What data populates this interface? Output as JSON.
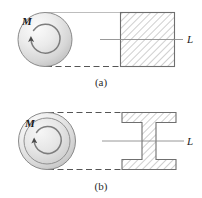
{
  "figure": {
    "kind": "engineering-diagram",
    "background_color": "#ffffff",
    "line_color": "#3a3a3a",
    "hatch_color": "#9a9a9a",
    "disk_fill_light": "#f2f2f2",
    "disk_fill_dark": "#c8c8c8",
    "dash_color": "#5a5a5a"
  },
  "panels": [
    {
      "id": "a",
      "caption": "(a)",
      "torque_label": "M",
      "length_label": "L",
      "shaft_type": "solid-disk",
      "section_type": "square",
      "arrow_direction": "clockwise"
    },
    {
      "id": "b",
      "caption": "(b)",
      "torque_label": "M",
      "length_label": "L",
      "shaft_type": "ringed-disk",
      "section_type": "i-beam",
      "arrow_direction": "clockwise"
    }
  ]
}
